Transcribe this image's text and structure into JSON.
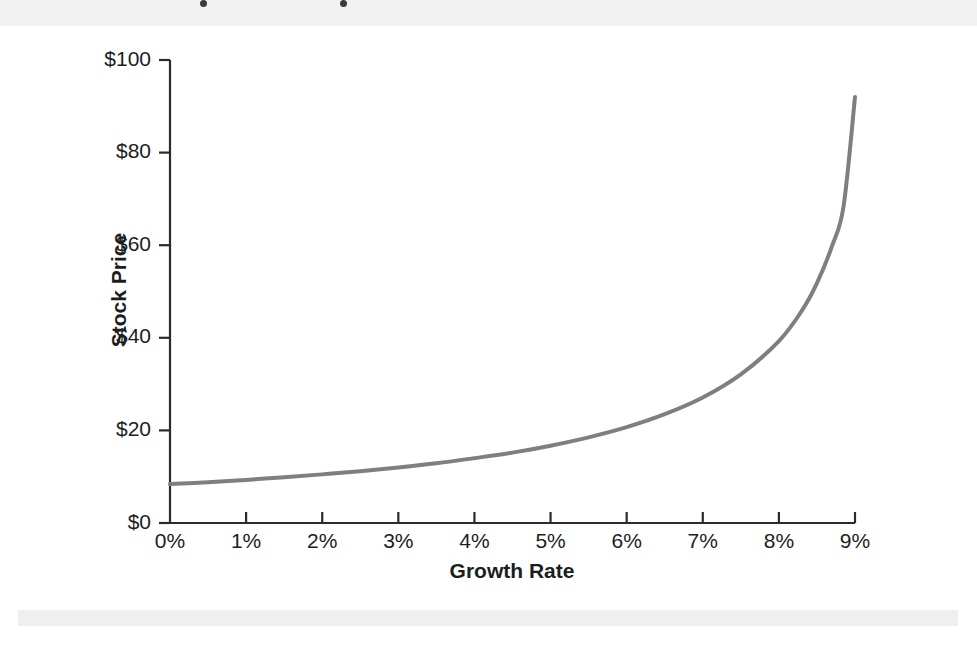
{
  "figure": {
    "background_color": "#ffffff",
    "axis_color": "#2b2b2b",
    "text_color": "#1d1d1d",
    "curve_color": "#7f7f7f",
    "curve_width": 4
  },
  "chart_data": {
    "type": "line",
    "title": "",
    "subtitle": "",
    "xlabel": "Growth Rate",
    "ylabel": "Stock Price",
    "x_tick_labels": [
      "0%",
      "1%",
      "2%",
      "3%",
      "4%",
      "5%",
      "6%",
      "7%",
      "8%",
      "9%"
    ],
    "y_tick_labels": [
      "$0",
      "$20",
      "$40",
      "$60",
      "$80",
      "$100"
    ],
    "x_ticks": [
      0,
      1,
      2,
      3,
      4,
      5,
      6,
      7,
      8,
      9
    ],
    "y_ticks": [
      0,
      20,
      40,
      60,
      80,
      100
    ],
    "xlim": [
      0,
      9
    ],
    "ylim": [
      0,
      100
    ],
    "grid": false,
    "legend": null,
    "legend_position": "none",
    "annotations": [],
    "series": [
      {
        "name": "Stock Price vs Growth Rate",
        "color": "#7f7f7f",
        "model": "P = D / (r - g)",
        "x": [
          0.0,
          0.5,
          1.0,
          1.5,
          2.0,
          2.5,
          3.0,
          3.5,
          4.0,
          4.5,
          5.0,
          5.5,
          6.0,
          6.5,
          7.0,
          7.5,
          8.0,
          8.3,
          8.5,
          8.7,
          8.85,
          9.0
        ],
        "values": [
          8.4,
          8.8,
          9.3,
          9.9,
          10.5,
          11.2,
          12.0,
          12.9,
          14.0,
          15.2,
          16.7,
          18.5,
          20.7,
          23.5,
          27.1,
          32.1,
          39.3,
          45.8,
          51.8,
          59.9,
          68.4,
          92.0
        ]
      }
    ]
  }
}
